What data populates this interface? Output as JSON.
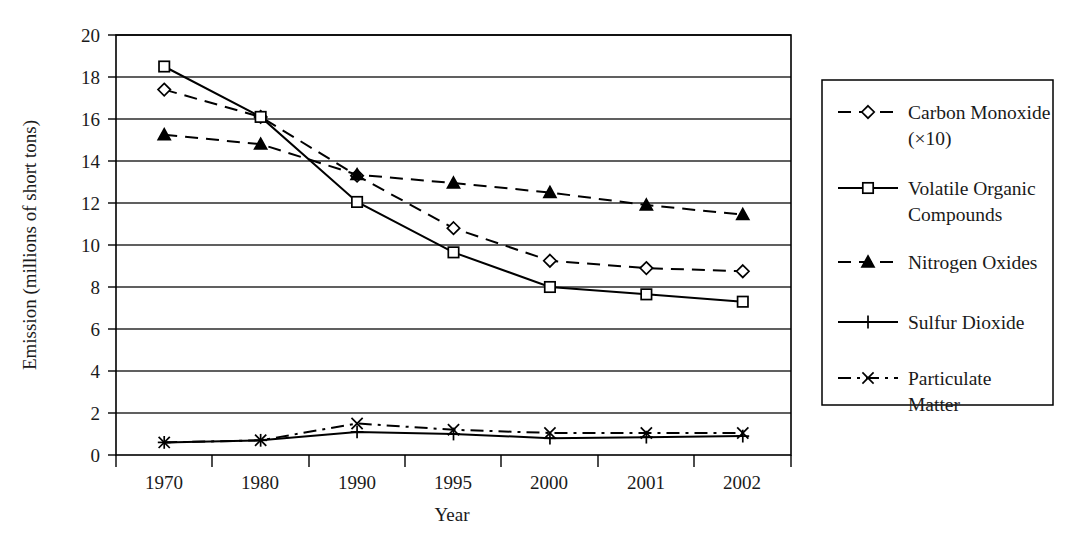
{
  "chart_data": {
    "type": "line",
    "title": "",
    "xlabel": "Year",
    "ylabel": "Emission (millions of short tons)",
    "categories": [
      "1970",
      "1980",
      "1990",
      "1995",
      "2000",
      "2001",
      "2002"
    ],
    "ylim": [
      0,
      20
    ],
    "ytick_step": 2,
    "yticks": [
      "0",
      "2",
      "4",
      "6",
      "8",
      "10",
      "12",
      "14",
      "16",
      "18",
      "20"
    ],
    "grid": "horizontal",
    "legend_position": "right-outside",
    "series": [
      {
        "name": "Carbon Monoxide (×10)",
        "label_lines": [
          "Carbon Monoxide",
          "(×10)"
        ],
        "marker": "diamond-hollow",
        "line_style": "dashed",
        "values": [
          17.4,
          16.1,
          13.3,
          10.8,
          9.25,
          8.9,
          8.75
        ]
      },
      {
        "name": "Volatile Organic Compounds",
        "label_lines": [
          "Volatile Organic",
          "Compounds"
        ],
        "marker": "square-hollow",
        "line_style": "solid",
        "values": [
          18.5,
          16.1,
          12.05,
          9.65,
          8.0,
          7.65,
          7.3
        ]
      },
      {
        "name": "Nitrogen Oxides",
        "label_lines": [
          "Nitrogen Oxides"
        ],
        "marker": "triangle-solid",
        "line_style": "dashed",
        "values": [
          15.25,
          14.8,
          13.35,
          12.95,
          12.5,
          11.9,
          11.45
        ]
      },
      {
        "name": "Sulfur Dioxide",
        "label_lines": [
          "Sulfur Dioxide"
        ],
        "marker": "plus",
        "line_style": "solid",
        "values": [
          0.6,
          0.7,
          1.1,
          1.0,
          0.8,
          0.85,
          0.9
        ]
      },
      {
        "name": "Particulate Matter",
        "label_lines": [
          "Particulate",
          "Matter"
        ],
        "marker": "x-cross",
        "line_style": "dash-dot",
        "values": [
          0.6,
          0.7,
          1.5,
          1.2,
          1.05,
          1.05,
          1.05
        ]
      }
    ]
  },
  "axis": {
    "y_title": "Emission (millions of short tons)",
    "x_title": "Year"
  },
  "legend": {
    "items": [
      {
        "line1": "Carbon Monoxide",
        "line2": "(×10)"
      },
      {
        "line1": "Volatile Organic",
        "line2": "Compounds"
      },
      {
        "line1": "Nitrogen Oxides",
        "line2": ""
      },
      {
        "line1": "Sulfur Dioxide",
        "line2": ""
      },
      {
        "line1": "Particulate",
        "line2": "Matter"
      }
    ]
  },
  "caption": {
    "text": ""
  },
  "colors": {
    "ink": "#1a1a1a",
    "line": "#000000",
    "grid": "#2b2b2b",
    "background": "#ffffff"
  }
}
